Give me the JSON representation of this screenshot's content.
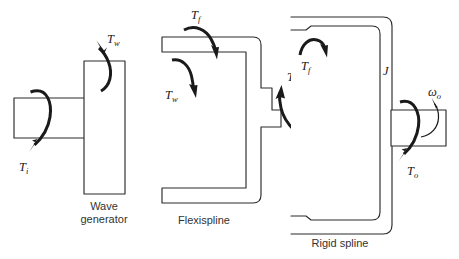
{
  "figure": {
    "background_color": "#ffffff",
    "line_color": "#2b2b2b",
    "arrow_color": "#1a1a1a",
    "text_color": "#1a1a1a",
    "caption_color": "#333333"
  },
  "components": [
    {
      "id": "wave-generator",
      "caption_line1": "Wave",
      "caption_line2": "generator",
      "caption_full": "Wave generator"
    },
    {
      "id": "flexispline",
      "caption_line1": "Flexispline",
      "caption_line2": "",
      "caption_full": "Flexispline"
    },
    {
      "id": "rigid-spline",
      "caption_line1": "Rigid spline",
      "caption_line2": "",
      "caption_full": "Rigid spline"
    }
  ],
  "labels": {
    "torque_input": {
      "symbol": "T",
      "subscript": "i"
    },
    "torque_wave_gen": {
      "symbol": "T",
      "subscript": "w"
    },
    "torque_wave_flex": {
      "symbol": "T",
      "subscript": "w"
    },
    "torque_flex_top": {
      "symbol": "T",
      "subscript": "f"
    },
    "torque_flex_right": {
      "symbol": "T",
      "subscript": "f"
    },
    "torque_rigid": {
      "symbol": "T",
      "subscript": "f"
    },
    "torque_output": {
      "symbol": "T",
      "subscript": "o"
    },
    "inertia": {
      "symbol": "J",
      "subscript": ""
    },
    "omega_output": {
      "symbol": "ω",
      "subscript": "o"
    }
  }
}
